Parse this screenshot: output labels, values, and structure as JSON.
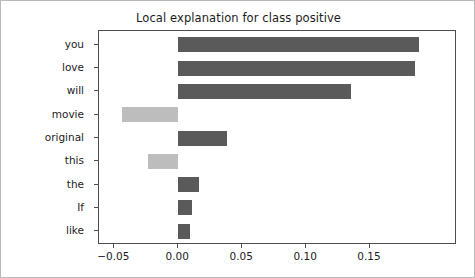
{
  "chart_data": {
    "type": "bar",
    "orientation": "horizontal",
    "title": "Local explanation for class positive",
    "xlabel": "",
    "ylabel": "",
    "categories": [
      "you",
      "love",
      "will",
      "movie",
      "original",
      "this",
      "the",
      "If",
      "like"
    ],
    "values": [
      0.188,
      0.185,
      0.135,
      -0.044,
      0.038,
      -0.024,
      0.016,
      0.011,
      0.009
    ],
    "xlim": [
      -0.062,
      0.218
    ],
    "ylim": [
      -0.6,
      8.6
    ],
    "xticks": [
      -0.05,
      0.0,
      0.05,
      0.1,
      0.15
    ],
    "xticklabels": [
      "−0.05",
      "0.00",
      "0.05",
      "0.10",
      "0.15"
    ],
    "grid": false,
    "legend": null,
    "colors": {
      "positive": "#5a5a5a",
      "negative": "#bdbdbd",
      "axis": "#4d4d4d",
      "text": "#1c1c1c",
      "background": "#ffffff",
      "frame": "#b9b9b9"
    }
  }
}
